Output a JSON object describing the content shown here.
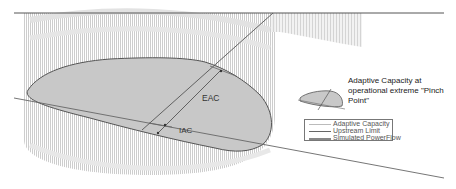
{
  "diagram": {
    "type": "adaptive-capacity-envelope",
    "colors": {
      "envelope_fill": "#c8c8c8",
      "envelope_stroke": "#555555",
      "hatch": "#bdbdbd",
      "line": "#555555",
      "background": "#ffffff"
    },
    "labels": {
      "eac": "EAC",
      "iac": "IAC"
    },
    "pinch_point": {
      "line1": "Adaptive Capacity at",
      "line2": "operational extreme \"Pinch",
      "line3": "Point\""
    },
    "legend": {
      "items": [
        {
          "label": "Adaptive Capacity",
          "style": "thin"
        },
        {
          "label": "Upstream Limit",
          "style": "solid"
        },
        {
          "label": "Simulated PowerFlow",
          "style": "double"
        }
      ]
    }
  }
}
